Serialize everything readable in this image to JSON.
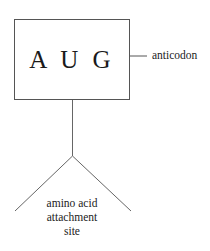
{
  "diagram": {
    "codon_box": {
      "text": "A U G"
    },
    "labels": {
      "anticodon": "anticodon",
      "attachment_site": [
        "amino acid",
        "attachment",
        "site"
      ]
    },
    "colors": {
      "line": "#555555",
      "text": "#222222"
    }
  }
}
